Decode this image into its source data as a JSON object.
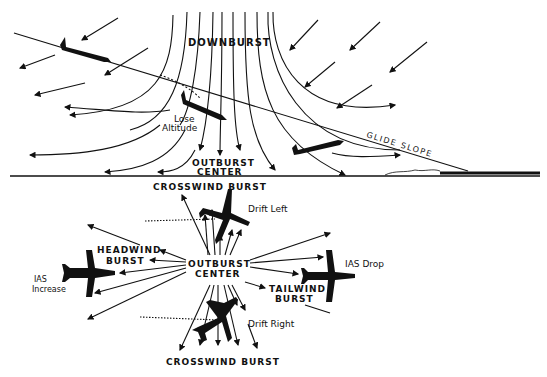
{
  "diagram": {
    "top_panel": {
      "title": "DOWNBURST",
      "lose_altitude_line1": "Lose",
      "lose_altitude_line2": "Altitude",
      "outburst_line1": "OUTBURST",
      "outburst_line2": "CENTER",
      "glide_slope": "GLIDE SLOPE"
    },
    "bottom_panel": {
      "crosswind_top": "CROSSWIND BURST",
      "crosswind_bottom": "CROSSWIND BURST",
      "drift_left": "Drift Left",
      "drift_right": "Drift Right",
      "headwind_line1": "HEADWIND",
      "headwind_line2": "BURST",
      "tailwind_line1": "TAILWIND",
      "tailwind_line2": "BURST",
      "center_line1": "OUTBURST",
      "center_line2": "CENTER",
      "ias_increase_line1": "IAS",
      "ias_increase_line2": "Increase",
      "ias_drop": "IAS Drop"
    },
    "colors": {
      "ink": "#111111",
      "background": "#ffffff"
    }
  }
}
